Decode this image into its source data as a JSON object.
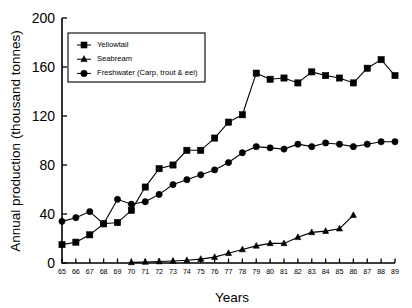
{
  "chart_data": {
    "type": "line",
    "title": "",
    "xlabel": "Years",
    "ylabel": "Annual production (thousand tonnes)",
    "xlim": [
      65,
      89
    ],
    "ylim": [
      0,
      200
    ],
    "yticks": [
      0,
      40,
      80,
      120,
      160,
      200
    ],
    "ytick_labels": [
      "0",
      "40",
      "80",
      "120",
      "160",
      "200"
    ],
    "grid": false,
    "legend_position": "upper-left",
    "categories": [
      65,
      66,
      67,
      68,
      69,
      70,
      71,
      72,
      73,
      74,
      75,
      76,
      77,
      78,
      79,
      80,
      81,
      82,
      83,
      84,
      85,
      86,
      87,
      88,
      89
    ],
    "xtick_labels": [
      "65",
      "66",
      "67",
      "68",
      "69",
      "70",
      "71",
      "72",
      "73",
      "74",
      "75",
      "76",
      "77",
      "78",
      "79",
      "80",
      "81",
      "82",
      "83",
      "84",
      "85",
      "86",
      "87",
      "88",
      "89"
    ],
    "series": [
      {
        "name": "Yellowtail",
        "marker": "square",
        "color": "#000000",
        "values": [
          15,
          17,
          23,
          32,
          33,
          43,
          62,
          77,
          80,
          92,
          92,
          102,
          115,
          121,
          155,
          150,
          151,
          147,
          156,
          153,
          151,
          147,
          159,
          166,
          153
        ]
      },
      {
        "name": "Seabream",
        "marker": "triangle",
        "color": "#000000",
        "values": [
          null,
          null,
          null,
          null,
          null,
          0.5,
          0.8,
          1.2,
          1.6,
          2.2,
          3.2,
          4.8,
          8,
          11,
          14,
          16,
          16,
          21,
          25,
          26,
          28,
          39,
          null,
          null,
          null
        ]
      },
      {
        "name": "Freshwater (Carp, trout & eel)",
        "marker": "circle",
        "color": "#000000",
        "values": [
          34,
          37,
          42,
          32,
          52,
          48,
          50,
          56,
          64,
          68,
          72,
          76,
          82,
          90,
          95,
          94,
          93,
          97,
          95,
          98,
          97,
          95,
          97,
          99,
          99
        ]
      }
    ]
  },
  "legend": {
    "items": [
      {
        "label": "Yellowtail",
        "marker": "square"
      },
      {
        "label": "Seabream",
        "marker": "triangle"
      },
      {
        "label": "Freshwater (Carp, trout & eel)",
        "marker": "circle"
      }
    ]
  },
  "axes": {
    "x_title": "Years",
    "y_title": "Annual production (thousand tonnes)"
  }
}
